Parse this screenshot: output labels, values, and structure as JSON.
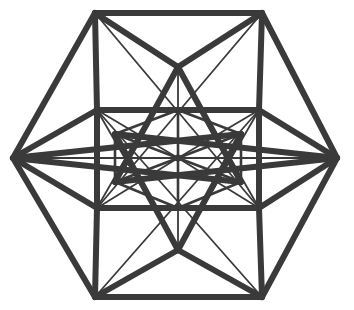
{
  "figure": {
    "background_color": "#ffffff",
    "line_color": "#3a3a3a",
    "canvas": {
      "width": 354,
      "height": 310
    },
    "center": {
      "x": 178,
      "y": 158
    },
    "stroke_widths": {
      "thick": 6.0,
      "medium": 4.0,
      "thin": 2.6,
      "hair": 1.8
    },
    "vertices": {
      "outer_hexagon": [
        {
          "name": "left",
          "x": 13,
          "y": 158
        },
        {
          "name": "top-left",
          "x": 95,
          "y": 13
        },
        {
          "name": "top-right",
          "x": 262,
          "y": 13
        },
        {
          "name": "right",
          "x": 337,
          "y": 158
        },
        {
          "name": "bottom-right",
          "x": 262,
          "y": 297
        },
        {
          "name": "bottom-left",
          "x": 95,
          "y": 297
        }
      ],
      "inner_rectangle": [
        {
          "name": "rect-top-left",
          "x": 97,
          "y": 110
        },
        {
          "name": "rect-top-right",
          "x": 259,
          "y": 110
        },
        {
          "name": "rect-bottom-right",
          "x": 259,
          "y": 208
        },
        {
          "name": "rect-bottom-left",
          "x": 97,
          "y": 208
        }
      ],
      "inner_hexagon": [
        {
          "name": "inner-top",
          "x": 178,
          "y": 110
        },
        {
          "name": "inner-upper-right",
          "x": 241,
          "y": 134
        },
        {
          "name": "inner-lower-right",
          "x": 241,
          "y": 182
        },
        {
          "name": "inner-bottom",
          "x": 178,
          "y": 208
        },
        {
          "name": "inner-lower-left",
          "x": 115,
          "y": 182
        },
        {
          "name": "inner-upper-left",
          "x": 115,
          "y": 134
        }
      ],
      "star_apex": [
        {
          "name": "star-apex-top",
          "x": 178,
          "y": 67
        },
        {
          "name": "star-apex-bottom",
          "x": 178,
          "y": 250
        }
      ],
      "center_hub": {
        "name": "center",
        "x": 178,
        "y": 158
      }
    },
    "edges": {
      "outer_hexagon": [
        {
          "name": "outer-edge-left-upper",
          "from": [
            13,
            158
          ],
          "to": [
            95,
            13
          ],
          "weight": "thick"
        },
        {
          "name": "outer-edge-top",
          "from": [
            95,
            13
          ],
          "to": [
            262,
            13
          ],
          "weight": "thick"
        },
        {
          "name": "outer-edge-right-upper",
          "from": [
            262,
            13
          ],
          "to": [
            337,
            158
          ],
          "weight": "thick"
        },
        {
          "name": "outer-edge-right-lower",
          "from": [
            337,
            158
          ],
          "to": [
            262,
            297
          ],
          "weight": "thick"
        },
        {
          "name": "outer-edge-bottom",
          "from": [
            262,
            297
          ],
          "to": [
            95,
            297
          ],
          "weight": "thick"
        },
        {
          "name": "outer-edge-left-lower",
          "from": [
            95,
            297
          ],
          "to": [
            13,
            158
          ],
          "weight": "thick"
        }
      ],
      "inner_rectangle": [
        {
          "name": "rect-edge-top",
          "from": [
            97,
            110
          ],
          "to": [
            259,
            110
          ],
          "weight": "thick"
        },
        {
          "name": "rect-edge-right",
          "from": [
            259,
            110
          ],
          "to": [
            259,
            208
          ],
          "weight": "thick"
        },
        {
          "name": "rect-edge-bottom",
          "from": [
            259,
            208
          ],
          "to": [
            97,
            208
          ],
          "weight": "thick"
        },
        {
          "name": "rect-edge-left",
          "from": [
            97,
            208
          ],
          "to": [
            97,
            110
          ],
          "weight": "thick"
        }
      ],
      "corner_links": [
        {
          "name": "link-outer-tl-rect-tl",
          "from": [
            95,
            13
          ],
          "to": [
            97,
            110
          ],
          "weight": "thick"
        },
        {
          "name": "link-outer-tr-rect-tr",
          "from": [
            262,
            13
          ],
          "to": [
            259,
            110
          ],
          "weight": "thick"
        },
        {
          "name": "link-outer-bl-rect-bl",
          "from": [
            95,
            297
          ],
          "to": [
            97,
            208
          ],
          "weight": "thick"
        },
        {
          "name": "link-outer-br-rect-br",
          "from": [
            262,
            297
          ],
          "to": [
            259,
            208
          ],
          "weight": "thick"
        },
        {
          "name": "link-left-rect-tl",
          "from": [
            13,
            158
          ],
          "to": [
            97,
            110
          ],
          "weight": "thick"
        },
        {
          "name": "link-left-rect-bl",
          "from": [
            13,
            158
          ],
          "to": [
            97,
            208
          ],
          "weight": "thick"
        },
        {
          "name": "link-right-rect-tr",
          "from": [
            337,
            158
          ],
          "to": [
            259,
            110
          ],
          "weight": "thick"
        },
        {
          "name": "link-right-rect-br",
          "from": [
            337,
            158
          ],
          "to": [
            259,
            208
          ],
          "weight": "thick"
        }
      ],
      "star_rays": [
        {
          "name": "star-ray-tl-apex-top",
          "from": [
            95,
            13
          ],
          "to": [
            178,
            67
          ],
          "weight": "thick"
        },
        {
          "name": "star-ray-tr-apex-top",
          "from": [
            262,
            13
          ],
          "to": [
            178,
            67
          ],
          "weight": "thick"
        },
        {
          "name": "star-ray-bl-apex-bottom",
          "from": [
            95,
            297
          ],
          "to": [
            178,
            250
          ],
          "weight": "thick"
        },
        {
          "name": "star-ray-br-apex-bottom",
          "from": [
            262,
            297
          ],
          "to": [
            178,
            250
          ],
          "weight": "thick"
        },
        {
          "name": "star-ray-apex-top-ilr",
          "from": [
            178,
            67
          ],
          "to": [
            241,
            182
          ],
          "weight": "thick"
        },
        {
          "name": "star-ray-apex-top-ill",
          "from": [
            178,
            67
          ],
          "to": [
            115,
            182
          ],
          "weight": "thick"
        },
        {
          "name": "star-ray-apex-bot-iur",
          "from": [
            178,
            250
          ],
          "to": [
            241,
            134
          ],
          "weight": "thick"
        },
        {
          "name": "star-ray-apex-bot-iul",
          "from": [
            178,
            250
          ],
          "to": [
            115,
            134
          ],
          "weight": "thick"
        },
        {
          "name": "star-ray-left-iur",
          "from": [
            13,
            158
          ],
          "to": [
            241,
            134
          ],
          "weight": "thick"
        },
        {
          "name": "star-ray-left-ilr",
          "from": [
            13,
            158
          ],
          "to": [
            241,
            182
          ],
          "weight": "thick"
        },
        {
          "name": "star-ray-right-iul",
          "from": [
            337,
            158
          ],
          "to": [
            115,
            134
          ],
          "weight": "thick"
        },
        {
          "name": "star-ray-right-ill",
          "from": [
            337,
            158
          ],
          "to": [
            115,
            182
          ],
          "weight": "thick"
        }
      ],
      "inner_hexagon": [
        {
          "name": "inner-edge-ne",
          "from": [
            178,
            110
          ],
          "to": [
            241,
            134
          ],
          "weight": "thin"
        },
        {
          "name": "inner-edge-e",
          "from": [
            241,
            134
          ],
          "to": [
            241,
            182
          ],
          "weight": "thin"
        },
        {
          "name": "inner-edge-se",
          "from": [
            241,
            182
          ],
          "to": [
            178,
            208
          ],
          "weight": "thin"
        },
        {
          "name": "inner-edge-sw",
          "from": [
            178,
            208
          ],
          "to": [
            115,
            182
          ],
          "weight": "thin"
        },
        {
          "name": "inner-edge-w",
          "from": [
            115,
            182
          ],
          "to": [
            115,
            134
          ],
          "weight": "thin"
        },
        {
          "name": "inner-edge-nw",
          "from": [
            115,
            134
          ],
          "to": [
            178,
            110
          ],
          "weight": "thin"
        }
      ],
      "hub_spokes": [
        {
          "name": "spoke-to-inner-top",
          "from": [
            178,
            158
          ],
          "to": [
            178,
            110
          ],
          "weight": "thin"
        },
        {
          "name": "spoke-to-inner-upper-right",
          "from": [
            178,
            158
          ],
          "to": [
            241,
            134
          ],
          "weight": "thin"
        },
        {
          "name": "spoke-to-inner-lower-right",
          "from": [
            178,
            158
          ],
          "to": [
            241,
            182
          ],
          "weight": "thin"
        },
        {
          "name": "spoke-to-inner-bottom",
          "from": [
            178,
            158
          ],
          "to": [
            178,
            208
          ],
          "weight": "thin"
        },
        {
          "name": "spoke-to-inner-lower-left",
          "from": [
            178,
            158
          ],
          "to": [
            115,
            182
          ],
          "weight": "thin"
        },
        {
          "name": "spoke-to-inner-upper-left",
          "from": [
            178,
            158
          ],
          "to": [
            115,
            134
          ],
          "weight": "thin"
        },
        {
          "name": "spoke-to-left-vertex",
          "from": [
            178,
            158
          ],
          "to": [
            13,
            158
          ],
          "weight": "hair"
        },
        {
          "name": "spoke-to-right-vertex",
          "from": [
            178,
            158
          ],
          "to": [
            337,
            158
          ],
          "weight": "hair"
        },
        {
          "name": "spoke-to-apex-top",
          "from": [
            178,
            158
          ],
          "to": [
            178,
            67
          ],
          "weight": "hair"
        },
        {
          "name": "spoke-to-apex-bottom",
          "from": [
            178,
            158
          ],
          "to": [
            178,
            250
          ],
          "weight": "hair"
        },
        {
          "name": "spoke-to-rect-top-left",
          "from": [
            178,
            158
          ],
          "to": [
            97,
            110
          ],
          "weight": "hair"
        },
        {
          "name": "spoke-to-rect-top-right",
          "from": [
            178,
            158
          ],
          "to": [
            259,
            110
          ],
          "weight": "hair"
        },
        {
          "name": "spoke-to-rect-bottom-left",
          "from": [
            178,
            158
          ],
          "to": [
            97,
            208
          ],
          "weight": "hair"
        },
        {
          "name": "spoke-to-rect-bottom-right",
          "from": [
            178,
            158
          ],
          "to": [
            259,
            208
          ],
          "weight": "hair"
        }
      ],
      "diagonals": [
        {
          "name": "diagonal-rect-tl-to-apex-bottom",
          "from": [
            97,
            110
          ],
          "to": [
            178,
            250
          ],
          "weight": "hair"
        },
        {
          "name": "diagonal-rect-tr-to-apex-bottom",
          "from": [
            259,
            110
          ],
          "to": [
            178,
            250
          ],
          "weight": "hair"
        },
        {
          "name": "diagonal-rect-bl-to-apex-top",
          "from": [
            97,
            208
          ],
          "to": [
            178,
            67
          ],
          "weight": "hair"
        },
        {
          "name": "diagonal-rect-br-to-apex-top",
          "from": [
            259,
            208
          ],
          "to": [
            178,
            67
          ],
          "weight": "hair"
        },
        {
          "name": "diagonal-tl-to-rect-br",
          "from": [
            95,
            13
          ],
          "to": [
            259,
            208
          ],
          "weight": "hair"
        },
        {
          "name": "diagonal-tr-to-rect-bl",
          "from": [
            262,
            13
          ],
          "to": [
            97,
            208
          ],
          "weight": "hair"
        },
        {
          "name": "diagonal-bl-to-rect-tr",
          "from": [
            95,
            297
          ],
          "to": [
            259,
            110
          ],
          "weight": "hair"
        },
        {
          "name": "diagonal-br-to-rect-tl",
          "from": [
            262,
            297
          ],
          "to": [
            97,
            110
          ],
          "weight": "hair"
        }
      ]
    },
    "hub": {
      "name": "center-hub-dot",
      "x": 178,
      "y": 158,
      "radius": 3.6
    }
  }
}
